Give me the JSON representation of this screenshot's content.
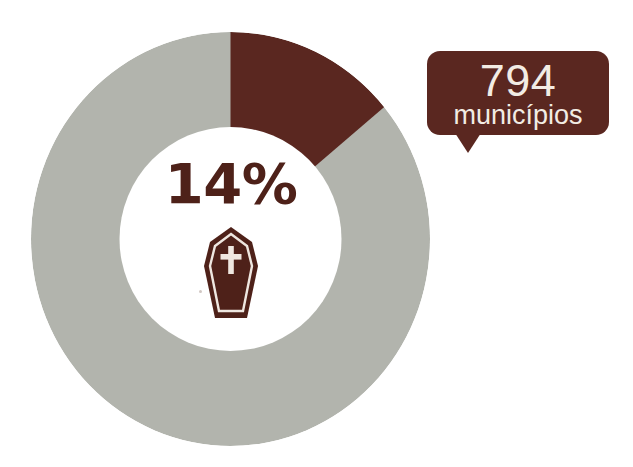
{
  "canvas": {
    "width": 633,
    "height": 467,
    "background": "#ffffff"
  },
  "palette": {
    "highlight": "#5a2720",
    "remainder": "#b2b4ad",
    "hole": "#ffffff",
    "callout_bg": "#5a2720",
    "callout_text": "#f2ece4",
    "pct_text": "#4e2119"
  },
  "center": {
    "percent_label": "14%",
    "icon": "coffin-icon"
  },
  "callout": {
    "number": "794",
    "label": "municípios",
    "tail": "down"
  },
  "chart_data": {
    "type": "pie",
    "variant": "donut",
    "title": "",
    "subtitle": "",
    "xlabel": "",
    "ylabel": "",
    "categories": [
      "Municípios afetados",
      "Demais municípios"
    ],
    "values": [
      14,
      86
    ],
    "value_unit": "percent",
    "absolute_values": [
      794,
      null
    ],
    "absolute_unit": "municípios",
    "colors": [
      "#5a2720",
      "#b2b4ad"
    ],
    "start_angle_deg": 0,
    "direction": "clockwise",
    "inner_radius_ratio": 0.54,
    "center_label": "14%",
    "center_icon": "coffin-icon",
    "annotations": [
      {
        "text": "794 municípios",
        "target_category": "Municípios afetados",
        "style": "callout-bubble"
      }
    ],
    "legend": "none",
    "grid": false
  }
}
